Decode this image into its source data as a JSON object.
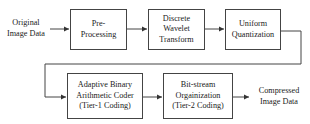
{
  "diagram": {
    "input_label": [
      "Original",
      "Image Data"
    ],
    "output_label": [
      "Compressed",
      "Image Data"
    ],
    "blocks": [
      {
        "id": "preprocessing",
        "lines": [
          "Pre-",
          "Processing"
        ]
      },
      {
        "id": "dwt",
        "lines": [
          "Discrete",
          "Wavelet",
          "Transform"
        ]
      },
      {
        "id": "quantization",
        "lines": [
          "Uniform",
          "Quantization"
        ]
      },
      {
        "id": "tier1",
        "lines": [
          "Adaptive Binary",
          "Arithmetic Coder",
          "(Tier-1 Coding)"
        ]
      },
      {
        "id": "tier2",
        "lines": [
          "Bit-stream",
          "Orgainization",
          "(Tier-2 Coding)"
        ]
      }
    ],
    "flow": [
      "input",
      "preprocessing",
      "dwt",
      "quantization",
      "tier1",
      "tier2",
      "output"
    ],
    "colors": {
      "stroke": "#444444",
      "text": "#222222",
      "background": "#ffffff"
    }
  }
}
